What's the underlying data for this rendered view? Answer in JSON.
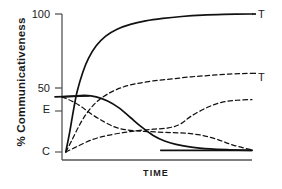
{
  "chart_data": {
    "type": "line",
    "title": "",
    "subtitle": "",
    "xlabel": "TIME",
    "ylabel": "% Communicativeness",
    "xlim": [
      0,
      100
    ],
    "ylim": [
      0,
      100
    ],
    "grid": false,
    "legend_position": "right-endpoint-labels",
    "x_ticks": [],
    "x_tick_labels": [],
    "y_ticks": [
      0,
      40,
      50,
      100
    ],
    "y_tick_labels": [
      "C",
      "E",
      "50",
      "100"
    ],
    "y_tick_label_notes": {
      "C": "baseline value 0, labelled C",
      "E": "approximately 40, labelled E",
      "50": "50",
      "100": "100"
    },
    "annotations": [
      {
        "text": "T",
        "x": 100,
        "y": 100,
        "note": "end label of solid rising curve"
      },
      {
        "text": "T",
        "x": 100,
        "y": 57,
        "note": "end label of dashed rising curve"
      }
    ],
    "series": [
      {
        "name": "solid-rising-to-T",
        "style": "solid",
        "end_label": "T",
        "x": [
          2,
          4,
          6,
          8,
          11,
          14,
          18,
          23,
          29,
          36,
          44,
          53,
          63,
          74,
          85,
          100
        ],
        "values": [
          0,
          14,
          30,
          44,
          58,
          68,
          77,
          84,
          89,
          92.5,
          95,
          96.8,
          98.2,
          99.2,
          99.7,
          100
        ]
      },
      {
        "name": "dashed-rising-to-T",
        "style": "dashed",
        "end_label": "T",
        "x": [
          2,
          5,
          9,
          13,
          18,
          24,
          31,
          39,
          48,
          58,
          68,
          78,
          88,
          100
        ],
        "values": [
          0,
          8,
          19,
          28,
          36,
          42,
          46.5,
          49.5,
          51.5,
          53,
          54.5,
          55.5,
          56.5,
          57
        ]
      },
      {
        "name": "solid-from-E-decaying",
        "style": "solid",
        "end_label": "",
        "x": [
          0,
          6,
          12,
          18,
          24,
          30,
          36,
          42,
          48,
          54,
          60,
          68,
          78,
          88,
          100
        ],
        "values": [
          40,
          40.5,
          41,
          40,
          37,
          32,
          25,
          18,
          12,
          8,
          5.5,
          3.5,
          2.2,
          1.6,
          1.2
        ]
      },
      {
        "name": "dashed-falling-from-E-then-plateau",
        "style": "dashed",
        "end_label": "",
        "x": [
          0,
          5,
          10,
          16,
          22,
          28,
          34,
          42,
          50,
          58,
          66,
          74,
          82,
          90,
          100
        ],
        "values": [
          40,
          37,
          33,
          27,
          22,
          18,
          16,
          15,
          14.5,
          14,
          13.5,
          12,
          9,
          5,
          1.5
        ]
      },
      {
        "name": "dashed-low-rise-hump",
        "style": "dashed",
        "end_label": "",
        "x": [
          2,
          8,
          16,
          24,
          32,
          40,
          48,
          56,
          62,
          68,
          76,
          84,
          92,
          100
        ],
        "values": [
          0,
          4,
          9,
          12,
          14,
          15.5,
          16.5,
          17.5,
          20,
          26,
          32,
          36,
          37.5,
          38
        ]
      }
    ],
    "colors": {
      "line": "#111111",
      "axis": "#555555",
      "background": "#ffffff"
    }
  }
}
